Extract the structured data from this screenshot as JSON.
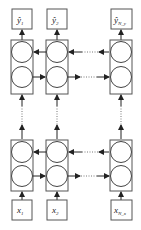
{
  "diagram": {
    "type": "bidirectional-stacked-rnn",
    "outputs": [
      {
        "base": "ŷ",
        "sub": "1"
      },
      {
        "base": "ŷ",
        "sub": "2"
      },
      {
        "base": "ŷ",
        "sub": "N_y"
      }
    ],
    "inputs": [
      {
        "base": "x",
        "sub": "1"
      },
      {
        "base": "x",
        "sub": "2"
      },
      {
        "base": "x",
        "sub": "N_x"
      }
    ],
    "layers": [
      {
        "name": "top-layer",
        "cells": 3,
        "forward_direction": "right",
        "backward_direction": "left"
      },
      {
        "name": "bottom-layer",
        "cells": 3,
        "forward_direction": "right",
        "backward_direction": "left"
      }
    ],
    "colors": {
      "stroke": "#555555",
      "arrow": "#222222",
      "background": "#ffffff"
    }
  }
}
